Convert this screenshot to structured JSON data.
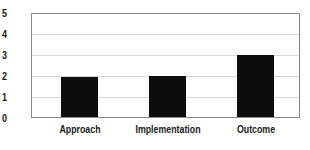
{
  "chart_data": {
    "type": "bar",
    "title": "",
    "subtitle": "",
    "xlabel": "",
    "ylabel": "",
    "categories": [
      "Approach",
      "Implementation",
      "Outcome"
    ],
    "values": [
      2.0,
      2.05,
      3.05
    ],
    "series": [
      {
        "name": "",
        "values": [
          2.0,
          2.05,
          3.05
        ]
      }
    ],
    "ylim": [
      0,
      5
    ],
    "yticks": [
      "0",
      "1",
      "2",
      "3",
      "4",
      "5"
    ],
    "ytick_values": [
      0,
      1,
      2,
      3,
      4,
      5
    ],
    "grid": true,
    "grid_axis": "y",
    "legend": false,
    "legend_position": "none",
    "annotations": [],
    "colors": {
      "bar": "#0d0d0d",
      "frame": "#8a8a8a",
      "gridline": "#d8d8d8",
      "background": "#ffffff",
      "text": "#1a1a1a"
    }
  }
}
